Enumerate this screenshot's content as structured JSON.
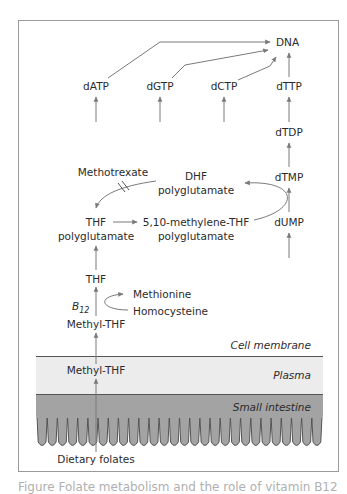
{
  "figure": {
    "nodes": {
      "dna": "DNA",
      "datp": "dATP",
      "dgtp": "dGTP",
      "dctp": "dCTP",
      "dttp": "dTTP",
      "dtdp": "dTDP",
      "dtmp": "dTMP",
      "dump": "dUMP",
      "methotrexate": "Methotrexate",
      "dhf_line1": "DHF",
      "dhf_line2": "polyglutamate",
      "thf_poly_line1": "THF",
      "thf_poly_line2": "polyglutamate",
      "methylene_line1": "5,10-methylene-THF",
      "methylene_line2": "polyglutamate",
      "thf": "THF",
      "methionine": "Methionine",
      "homocysteine": "Homocysteine",
      "b12_base": "B",
      "b12_sub": "12",
      "methyl_thf_cell": "Methyl-THF",
      "methyl_thf_plasma": "Methyl-THF",
      "dietary_folates": "Dietary folates"
    },
    "regions": {
      "cell_membrane": "Cell membrane",
      "plasma": "Plasma",
      "small_intestine": "Small intestine"
    },
    "colors": {
      "frame": "#9a9a9a",
      "arrow": "#7a7a7a",
      "plasma_band": "#ececec",
      "intestine_band": "#a3a3a3",
      "text": "#2b2b2b"
    }
  },
  "caption": "Figure  Folate metabolism and the role of vitamin B12"
}
